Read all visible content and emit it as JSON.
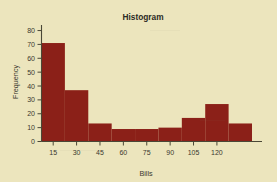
{
  "figure": {
    "background_color": "#ece5bd",
    "bar_color": "#8b2018",
    "axis_color": "#4a4736",
    "text_color": "#2b2a24"
  },
  "chart_data": {
    "type": "bar",
    "title": "Histogram",
    "xlabel": "Bills",
    "ylabel": "Frequency",
    "categories": [
      "15",
      "30",
      "45",
      "60",
      "75",
      "90",
      "105",
      "120",
      "135"
    ],
    "values": [
      71,
      37,
      13,
      9,
      9,
      10,
      17,
      27,
      13
    ],
    "bin_width": 15,
    "bin_edges": [
      7.5,
      22.5,
      37.5,
      52.5,
      67.5,
      82.5,
      97.5,
      112.5,
      127.5,
      142.5
    ],
    "xticks": [
      15,
      30,
      45,
      60,
      75,
      90,
      105,
      120
    ],
    "yticks": [
      0,
      10,
      20,
      30,
      40,
      50,
      60,
      70,
      80
    ],
    "xlim": [
      7.5,
      142.5
    ],
    "ylim": [
      0,
      84
    ],
    "grid": false,
    "legend": null,
    "ticklabels": {
      "x": [
        "15",
        "30",
        "45",
        "60",
        "75",
        "90",
        "105",
        "120"
      ],
      "y": [
        "0",
        "10",
        "20",
        "30",
        "40",
        "50",
        "60",
        "70",
        "80"
      ]
    }
  }
}
